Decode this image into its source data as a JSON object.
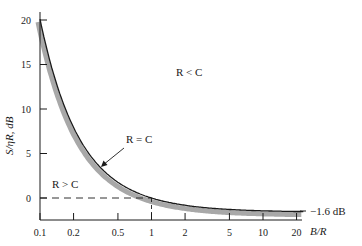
{
  "chart_data": {
    "type": "line",
    "title": "",
    "xlabel": "B/R",
    "ylabel": "S/ηR, dB",
    "xscale": "log",
    "xlim": [
      0.1,
      25
    ],
    "ylim": [
      -3,
      21
    ],
    "grid": false,
    "x_ticks": [
      0.1,
      0.2,
      0.5,
      1,
      2,
      5,
      10,
      20
    ],
    "x_tick_labels": [
      "0.1",
      "0.2",
      "0.5",
      "1",
      "2",
      "5",
      "10",
      "20"
    ],
    "y_ticks": [
      0,
      5,
      10,
      15,
      20
    ],
    "y_tick_labels": [
      "0",
      "5",
      "10",
      "15",
      "20"
    ],
    "series": [
      {
        "name": "R = C boundary",
        "x": [
          0.1,
          0.15,
          0.2,
          0.3,
          0.5,
          0.7,
          1,
          1.5,
          2,
          3,
          5,
          7,
          10,
          15,
          20,
          25
        ],
        "values": [
          20.1,
          13.2,
          9.9,
          6.0,
          1.8,
          0.7,
          0.0,
          -0.6,
          -0.8,
          -1.1,
          -1.3,
          -1.4,
          -1.5,
          -1.55,
          -1.56,
          -1.57
        ]
      }
    ],
    "reference_lines": [
      {
        "type": "horizontal",
        "y": 0,
        "style": "dashed",
        "from_x": 0.1,
        "to_x": 1
      },
      {
        "type": "vertical",
        "x": 1,
        "style": "dashed",
        "from_y": -3,
        "to_y": 0
      },
      {
        "type": "asymptote",
        "y": -1.6,
        "label": "−1.6 dB"
      }
    ],
    "annotations": [
      {
        "text": "R < C",
        "region": "above curve"
      },
      {
        "text": "R = C",
        "points_to": "curve",
        "arrow": true
      },
      {
        "text": "R > C",
        "region": "below curve"
      },
      {
        "text": "−1.6 dB",
        "at": "right asymptote"
      }
    ]
  },
  "labels": {
    "region_above": "R < C",
    "boundary": "R = C",
    "region_below": "R > C",
    "asymptote": "−1.6 dB",
    "xlabel": "B/R",
    "ylabel": "S/ηR, dB"
  },
  "colors": {
    "curve": "#1a1a1a",
    "shade": "#a8a8a8",
    "axis": "#1a1a1a"
  }
}
